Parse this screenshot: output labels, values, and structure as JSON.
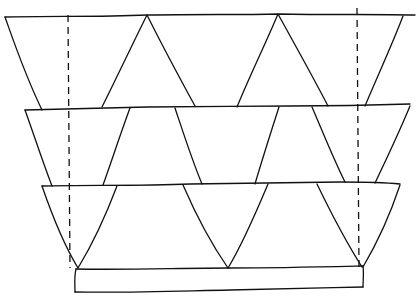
{
  "diagram": {
    "type": "hand-drawn line sketch",
    "colors": {
      "background": "#ffffff",
      "ink": "#111111"
    },
    "rows": [
      {
        "id": "row-1",
        "top_y": 15,
        "bottom_y": 107,
        "top_x": [
          5,
          415
        ],
        "bottom_x": [
          25,
          410
        ]
      },
      {
        "id": "row-2",
        "top_y": 108,
        "bottom_y": 185,
        "top_x": [
          25,
          410
        ],
        "bottom_x": [
          42,
          400
        ]
      },
      {
        "id": "row-3",
        "top_y": 185,
        "bottom_y": 268,
        "top_x": [
          42,
          400
        ],
        "bottom_x": [
          75,
          363
        ]
      }
    ],
    "base": {
      "x": 75,
      "y": 268,
      "width": 288,
      "height": 24
    },
    "dashed_lines": [
      {
        "x": 68,
        "y1": 15,
        "y2": 268
      },
      {
        "x": 357,
        "y1": 8,
        "y2": 268
      }
    ]
  }
}
